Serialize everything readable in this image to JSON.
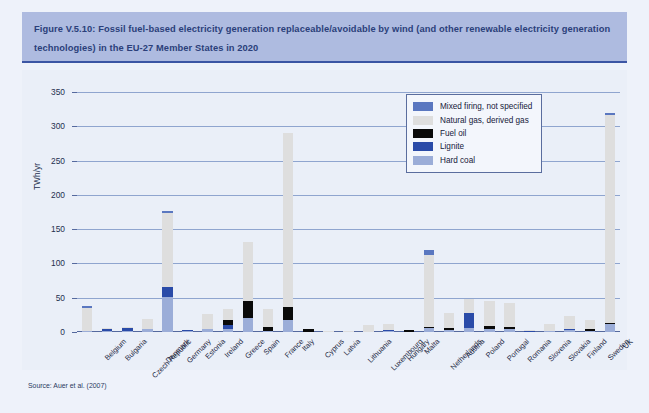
{
  "figure": {
    "title": "Figure V.5.10: Fossil fuel-based electricity generation replaceable/avoidable by wind (and other renewable electricity generation technologies) in the EU-27 Member States in 2020",
    "source": "Source: Auer et al. (2007)"
  },
  "colors": {
    "header_band": "#aebbe0",
    "title_text": "#2b3f7a",
    "panel": "#eaeff8",
    "gridline": "#8fa5cf",
    "mixed_firing": "#5a77c0",
    "natural_gas": "#dedede",
    "fuel_oil": "#0a0a0a",
    "lignite": "#2a4ba8",
    "hard_coal": "#9badd8"
  },
  "chart_data": {
    "type": "bar",
    "title": "Fossil fuel-based electricity generation replaceable/avoidable by wind (and other renewable electricity generation technologies) in the EU-27 Member States in 2020",
    "stacked": true,
    "xlabel": "",
    "ylabel": "TWh/yr",
    "ylim": [
      0,
      350
    ],
    "yticks": [
      0,
      50,
      100,
      150,
      200,
      250,
      300,
      350
    ],
    "grid": true,
    "legend_position": "top-right",
    "categories": [
      "Belgium",
      "Bulgaria",
      "Czech Republic",
      "Denmark",
      "Germany",
      "Estonia",
      "Ireland",
      "Greece",
      "Spain",
      "France",
      "Italy",
      "Cyprus",
      "Latvia",
      "Lithuania",
      "Luxembourg",
      "Hungary",
      "Malta",
      "Netherlands",
      "Austria",
      "Poland",
      "Portugal",
      "Romania",
      "Slovenia",
      "Slovakia",
      "Finland",
      "Sweden",
      "UK"
    ],
    "series": [
      {
        "name": "Hard coal",
        "color": "#9badd8",
        "values": [
          2,
          1,
          2,
          4,
          51,
          1,
          4,
          5,
          20,
          2,
          18,
          0,
          0,
          0,
          0,
          2,
          0,
          6,
          3,
          6,
          5,
          4,
          0,
          1,
          3,
          1,
          11
        ]
      },
      {
        "name": "Lignite",
        "color": "#2a4ba8",
        "values": [
          0,
          3,
          4,
          0,
          15,
          1,
          0,
          5,
          0,
          0,
          0,
          0,
          0,
          0,
          0,
          1,
          0,
          0,
          0,
          22,
          0,
          0,
          1,
          0,
          1,
          0,
          1
        ]
      },
      {
        "name": "Fuel oil",
        "color": "#0a0a0a",
        "values": [
          0,
          0,
          0,
          0,
          0,
          0,
          0,
          8,
          25,
          5,
          18,
          4,
          0,
          0,
          0,
          0,
          3,
          1,
          3,
          0,
          4,
          4,
          0,
          0,
          0,
          3,
          1
        ]
      },
      {
        "name": "Natural gas, derived gas",
        "color": "#dedede",
        "values": [
          33,
          2,
          1,
          15,
          108,
          0,
          22,
          15,
          87,
          26,
          254,
          0,
          1,
          1,
          10,
          8,
          0,
          105,
          22,
          20,
          36,
          35,
          2,
          10,
          20,
          14,
          304
        ]
      },
      {
        "name": "Mixed firing, not specified",
        "color": "#5a77c0",
        "values": [
          3,
          0,
          0,
          0,
          3,
          0,
          0,
          0,
          0,
          0,
          0,
          0,
          0,
          0,
          0,
          0,
          0,
          7,
          0,
          0,
          0,
          0,
          0,
          0,
          0,
          0,
          1
        ]
      }
    ],
    "totals": [
      38,
      6,
      7,
      19,
      177,
      2,
      26,
      33,
      132,
      33,
      290,
      4,
      1,
      1,
      10,
      11,
      3,
      119,
      28,
      48,
      45,
      43,
      3,
      11,
      24,
      18,
      318
    ]
  }
}
